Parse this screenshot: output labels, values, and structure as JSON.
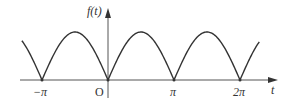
{
  "chart_data": {
    "type": "line",
    "title": "",
    "function": "f(t) = |sin t|",
    "xlabel": "t",
    "ylabel": "f(t)",
    "x_tick_labels": [
      "-π",
      "O",
      "π",
      "2π"
    ],
    "x_ticks": [
      -3.1416,
      0,
      3.1416,
      6.2832
    ],
    "x": [
      -4.1,
      -3.1416,
      -1.5708,
      0,
      1.5708,
      3.1416,
      4.7124,
      6.2832,
      7.2
    ],
    "values": [
      0.82,
      0,
      1,
      0,
      1,
      0,
      1,
      0,
      0.79
    ],
    "grid": false,
    "legend": null
  },
  "labels": {
    "ylabel": "f(t)",
    "xlabel": "t",
    "neg_pi": "−π",
    "origin": "O",
    "pi": "π",
    "two_pi": "2π"
  },
  "colors": {
    "curve": "#333333",
    "axis": "#555555"
  }
}
